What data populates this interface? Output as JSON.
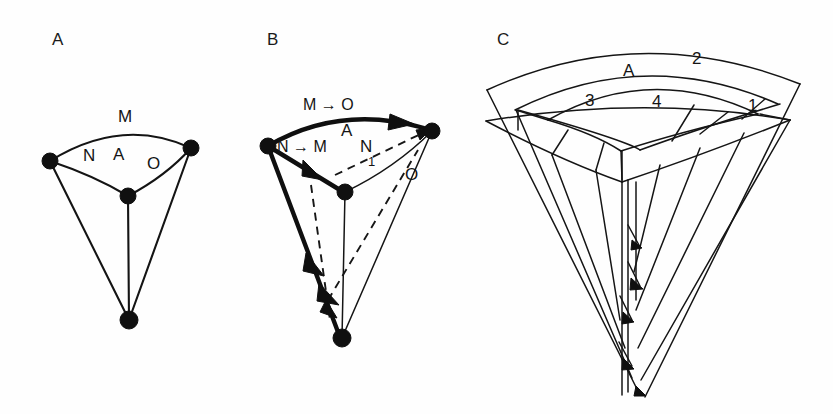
{
  "figure": {
    "background_color": "#fefefe",
    "ink_color": "#141414",
    "width": 833,
    "height": 414
  },
  "panels": [
    {
      "id": "A",
      "letter": "A",
      "letter_pos": {
        "x": 52,
        "y": 30
      },
      "description": "wedge-shaped segment with three labelled surface regions",
      "labels": [
        {
          "key": "m",
          "text": "M",
          "x": 118,
          "y": 108,
          "size": "lbl-lg"
        },
        {
          "key": "n",
          "text": "N",
          "x": 83,
          "y": 147,
          "size": "lbl-lg"
        },
        {
          "key": "a",
          "text": "A",
          "x": 113,
          "y": 146,
          "size": "lbl-lg"
        },
        {
          "key": "o",
          "text": "O",
          "x": 147,
          "y": 155,
          "size": "lbl-lg"
        }
      ],
      "nodes": [
        {
          "key": "left",
          "x": 50,
          "y": 161,
          "r": 8
        },
        {
          "key": "right",
          "x": 191,
          "y": 148,
          "r": 8
        },
        {
          "key": "center",
          "x": 128,
          "y": 196,
          "r": 8
        },
        {
          "key": "apex",
          "x": 129,
          "y": 320,
          "r": 8
        }
      ]
    },
    {
      "id": "B",
      "letter": "B",
      "letter_pos": {
        "x": 267,
        "y": 30
      },
      "description": "same wedge with bold directed edges and dashed rotated copy",
      "labels": [
        {
          "key": "m_to_o",
          "text": "M → O",
          "x": 303,
          "y": 97,
          "size": "lbl-md"
        },
        {
          "key": "n_to_m",
          "text": "N → M",
          "x": 277,
          "y": 139,
          "size": "lbl-md"
        },
        {
          "key": "a",
          "text": "A",
          "x": 341,
          "y": 122,
          "size": "lbl-lg"
        },
        {
          "key": "n1",
          "text": "N",
          "x": 360,
          "y": 138,
          "size": "lbl-lg"
        },
        {
          "key": "n1_sub",
          "text": "1",
          "x": 368,
          "y": 155,
          "size": "lbl-sub"
        },
        {
          "key": "o",
          "text": "O",
          "x": 405,
          "y": 166,
          "size": "lbl-lg"
        }
      ],
      "nodes": [
        {
          "key": "left",
          "x": 268,
          "y": 146,
          "r": 8
        },
        {
          "key": "right",
          "x": 432,
          "y": 131,
          "r": 8
        },
        {
          "key": "center",
          "x": 345,
          "y": 192,
          "r": 8
        },
        {
          "key": "apex",
          "x": 342,
          "y": 338,
          "r": 8
        }
      ],
      "arrow_edges": [
        {
          "key": "top-arc",
          "from": "left",
          "to": "right"
        },
        {
          "key": "left-to-center",
          "from": "left",
          "to": "center"
        },
        {
          "key": "left-to-apex",
          "from": "left",
          "to": "apex"
        }
      ]
    },
    {
      "id": "C",
      "letter": "C",
      "letter_pos": {
        "x": 497,
        "y": 30
      },
      "description": "nested fan of concentric wedge bands with numbered sectors",
      "labels": [
        {
          "key": "a",
          "text": "A",
          "x": 623,
          "y": 62,
          "size": "lbl-lg"
        },
        {
          "key": "2",
          "text": "2",
          "x": 692,
          "y": 50,
          "size": "lbl-lg"
        },
        {
          "key": "3",
          "text": "3",
          "x": 585,
          "y": 92,
          "size": "lbl-lg"
        },
        {
          "key": "4",
          "text": "4",
          "x": 652,
          "y": 93,
          "size": "lbl-lg"
        },
        {
          "key": "1",
          "text": "1",
          "x": 748,
          "y": 97,
          "size": "lbl-lg"
        }
      ]
    }
  ]
}
